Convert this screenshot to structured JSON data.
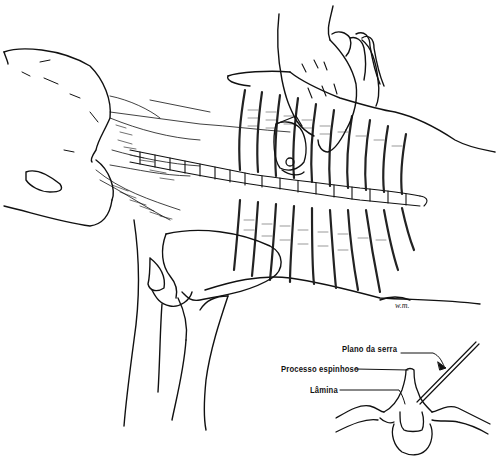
{
  "figure": {
    "colors": {
      "ink": "#111111",
      "background": "#ffffff"
    }
  },
  "inset": {
    "labels": {
      "saw_plane": "Plano da serra",
      "spinous_process": "Processo espinhoso",
      "lamina": "Lâmina"
    }
  },
  "signature": "w.m."
}
